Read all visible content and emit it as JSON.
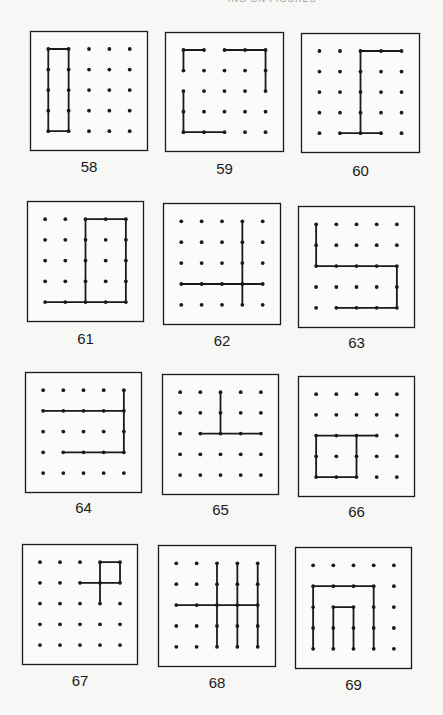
{
  "page": {
    "running_head": "ING ON FIGURES",
    "colors": {
      "ink": "#1a1a1a",
      "paper": "#f7f7f5"
    }
  },
  "grid": {
    "cols": 5,
    "rows": 5
  },
  "panels": [
    {
      "number": "58",
      "box": [
        30,
        31,
        118,
        120
      ],
      "label_y": 158,
      "paths": [
        [
          [
            0,
            0
          ],
          [
            1,
            0
          ],
          [
            1,
            4
          ],
          [
            0,
            4
          ],
          [
            0,
            0
          ]
        ]
      ]
    },
    {
      "number": "59",
      "box": [
        165,
        32,
        119,
        120
      ],
      "label_y": 160,
      "paths": [
        [
          [
            0,
            1
          ],
          [
            0,
            0
          ],
          [
            1,
            0
          ]
        ],
        [
          [
            2,
            0
          ],
          [
            4,
            0
          ],
          [
            4,
            2
          ]
        ],
        [
          [
            0,
            2
          ],
          [
            0,
            4
          ],
          [
            2,
            4
          ]
        ]
      ]
    },
    {
      "number": "60",
      "box": [
        301,
        33,
        119,
        120
      ],
      "label_y": 162,
      "paths": [
        [
          [
            4,
            0
          ],
          [
            2,
            0
          ],
          [
            2,
            4
          ]
        ],
        [
          [
            1,
            4
          ],
          [
            3,
            4
          ]
        ]
      ]
    },
    {
      "number": "61",
      "box": [
        27,
        201,
        117,
        121
      ],
      "label_y": 330,
      "paths": [
        [
          [
            2,
            0
          ],
          [
            4,
            0
          ],
          [
            4,
            4
          ],
          [
            2,
            4
          ],
          [
            2,
            0
          ]
        ],
        [
          [
            0,
            4
          ],
          [
            2,
            4
          ]
        ]
      ]
    },
    {
      "number": "62",
      "box": [
        163,
        203,
        118,
        122
      ],
      "label_y": 332,
      "paths": [
        [
          [
            3,
            0
          ],
          [
            3,
            4
          ]
        ],
        [
          [
            0,
            3
          ],
          [
            4,
            3
          ]
        ]
      ]
    },
    {
      "number": "63",
      "box": [
        298,
        206,
        117,
        122
      ],
      "label_y": 334,
      "paths": [
        [
          [
            0,
            0
          ],
          [
            0,
            2
          ],
          [
            4,
            2
          ],
          [
            4,
            4
          ],
          [
            1,
            4
          ]
        ]
      ]
    },
    {
      "number": "64",
      "box": [
        25,
        372,
        117,
        121
      ],
      "label_y": 499,
      "paths": [
        [
          [
            0,
            1
          ],
          [
            4,
            1
          ]
        ],
        [
          [
            4,
            0
          ],
          [
            4,
            3
          ],
          [
            1,
            3
          ]
        ]
      ]
    },
    {
      "number": "65",
      "box": [
        162,
        374,
        117,
        121
      ],
      "label_y": 501,
      "paths": [
        [
          [
            2,
            0
          ],
          [
            2,
            2
          ]
        ],
        [
          [
            1,
            2
          ],
          [
            4,
            2
          ]
        ]
      ]
    },
    {
      "number": "66",
      "box": [
        298,
        376,
        117,
        121
      ],
      "label_y": 503,
      "paths": [
        [
          [
            0,
            2
          ],
          [
            2,
            2
          ],
          [
            2,
            4
          ],
          [
            0,
            4
          ],
          [
            0,
            2
          ]
        ],
        [
          [
            2,
            2
          ],
          [
            3,
            2
          ]
        ]
      ]
    },
    {
      "number": "67",
      "box": [
        22,
        544,
        116,
        121
      ],
      "label_y": 672,
      "paths": [
        [
          [
            3,
            0
          ],
          [
            4,
            0
          ],
          [
            4,
            1
          ],
          [
            3,
            1
          ],
          [
            3,
            0
          ]
        ],
        [
          [
            3,
            1
          ],
          [
            3,
            2
          ]
        ],
        [
          [
            2,
            1
          ],
          [
            3,
            1
          ]
        ]
      ]
    },
    {
      "number": "68",
      "box": [
        158,
        545,
        118,
        122
      ],
      "label_y": 674,
      "paths": [
        [
          [
            2,
            0
          ],
          [
            2,
            4
          ]
        ],
        [
          [
            3,
            0
          ],
          [
            3,
            4
          ]
        ],
        [
          [
            4,
            0
          ],
          [
            4,
            4
          ]
        ],
        [
          [
            0,
            2
          ],
          [
            4,
            2
          ]
        ]
      ]
    },
    {
      "number": "69",
      "box": [
        295,
        547,
        117,
        122
      ],
      "label_y": 676,
      "paths": [
        [
          [
            0,
            4
          ],
          [
            0,
            1
          ],
          [
            3,
            1
          ],
          [
            3,
            4
          ]
        ],
        [
          [
            1,
            4
          ],
          [
            1,
            2
          ],
          [
            2,
            2
          ],
          [
            2,
            4
          ]
        ]
      ]
    }
  ]
}
